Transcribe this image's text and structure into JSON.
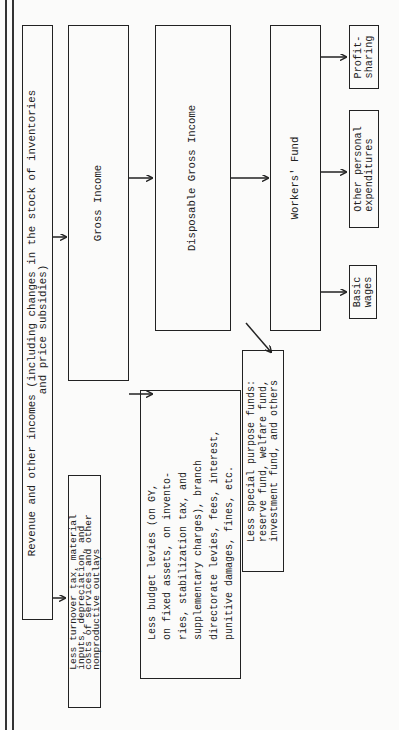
{
  "diagram": {
    "orientation": "rotated 90 degrees counter-clockwise (text reads bottom-to-top)",
    "nodes": {
      "revenue": {
        "label": "Revenue and other incomes (including changes in the stock of inventories\n                         and price subsidies)"
      },
      "less_turnover": {
        "label": "Less turnover tax, material\ninputs, depreciation, and\ncosts of services and other\nnonproductive outlays"
      },
      "gross_income": {
        "label": "Gross Income"
      },
      "less_budget_levies": {
        "label": "Less budget levies (on GY,\non fixed assets, on invento-\nries, stabilization tax, and\nsupplementary charges), branch\ndirectorate levies, fees, interest,\npunitive damages, fines, etc."
      },
      "disposable_gross_income": {
        "label": "Disposable Gross Income"
      },
      "less_special_purpose": {
        "label": "Less special purpose funds:\nreserve fund, welfare fund,\ninvestment fund, and others"
      },
      "workers_fund": {
        "label": "Workers' Fund"
      },
      "basic_wages": {
        "label": "Basic\nwages"
      },
      "other_personal": {
        "label": "Other personal\nexpenditures"
      },
      "profit_sharing": {
        "label": "Profit-\nsharing"
      }
    },
    "edges": [
      {
        "from": "revenue",
        "to": "gross_income"
      },
      {
        "from": "revenue",
        "to": "less_turnover"
      },
      {
        "from": "gross_income",
        "to": "disposable_gross_income"
      },
      {
        "from": "gross_income",
        "to": "less_budget_levies"
      },
      {
        "from": "disposable_gross_income",
        "to": "workers_fund"
      },
      {
        "from": "disposable_gross_income",
        "to": "less_special_purpose"
      },
      {
        "from": "workers_fund",
        "to": "basic_wages"
      },
      {
        "from": "workers_fund",
        "to": "other_personal"
      },
      {
        "from": "workers_fund",
        "to": "profit_sharing"
      }
    ]
  }
}
